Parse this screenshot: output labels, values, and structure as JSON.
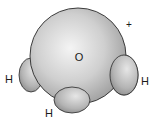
{
  "diagram": {
    "type": "space-filling molecular model",
    "central_atom": {
      "label": "O"
    },
    "hydrogens": [
      {
        "label": "H",
        "position": "left"
      },
      {
        "label": "H",
        "position": "bottom"
      },
      {
        "label": "H",
        "position": "right"
      }
    ],
    "charge": "+",
    "colors": {
      "sphere": "#c8c8c8",
      "highlight": "#f2f2f2",
      "outline": "#2a2a2a"
    }
  }
}
